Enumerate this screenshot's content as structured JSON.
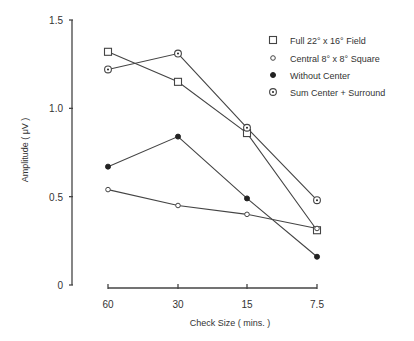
{
  "chart_data": {
    "type": "line",
    "title": "",
    "xlabel": "Check Size  ( mins. )",
    "ylabel": "Amplitude  ( μV )",
    "categories": [
      "60",
      "30",
      "15",
      "7.5"
    ],
    "yticks": [
      "0",
      "0.5",
      "1.0",
      "1.5"
    ],
    "ylim": [
      0,
      1.5
    ],
    "legend_position": "upper right",
    "grid": false,
    "series": [
      {
        "name": "Full 22° x 16° Field",
        "marker": "open-square",
        "values": [
          1.32,
          1.15,
          0.86,
          0.31
        ]
      },
      {
        "name": "Central 8° x 8° Square",
        "marker": "open-circle",
        "values": [
          0.54,
          0.45,
          0.4,
          0.32
        ]
      },
      {
        "name": "Without Center",
        "marker": "filled-circle",
        "values": [
          0.67,
          0.84,
          0.49,
          0.16
        ]
      },
      {
        "name": "Sum Center + Surround",
        "marker": "dotted-circle",
        "values": [
          1.22,
          1.31,
          0.89,
          0.48
        ]
      }
    ]
  }
}
